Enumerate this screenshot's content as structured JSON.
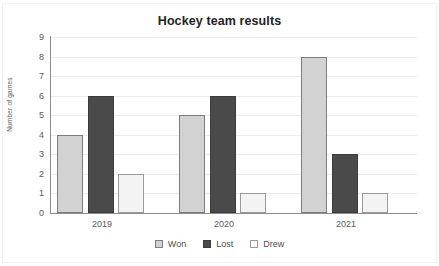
{
  "chart_data": {
    "type": "bar",
    "title": "Hockey team results",
    "xlabel": "",
    "ylabel": "Number of games",
    "categories": [
      "2019",
      "2020",
      "2021"
    ],
    "series": [
      {
        "name": "Won",
        "values": [
          4,
          5,
          8
        ],
        "color": "#d2d2d2"
      },
      {
        "name": "Lost",
        "values": [
          6,
          6,
          3
        ],
        "color": "#4a4a4a"
      },
      {
        "name": "Drew",
        "values": [
          2,
          1,
          1
        ],
        "color": "#f3f3f3"
      }
    ],
    "ylim": [
      0,
      9
    ],
    "yticks": [
      0,
      1,
      2,
      3,
      4,
      5,
      6,
      7,
      8,
      9
    ],
    "ytick_labels": [
      "0",
      "1",
      "2",
      "3",
      "4",
      "5",
      "6",
      "7",
      "8",
      "9"
    ],
    "grid": "horizontal",
    "legend_position": "bottom"
  },
  "axis": {
    "y_label": "Number of games",
    "y_ticks": [
      "9",
      "8",
      "7",
      "6",
      "5",
      "4",
      "3",
      "2",
      "1",
      "0"
    ],
    "x_ticks": [
      "2019",
      "2020",
      "2021"
    ]
  },
  "legend": {
    "items": [
      {
        "label": "Won",
        "swatch": "won-swatch"
      },
      {
        "label": "Lost",
        "swatch": "lost-swatch"
      },
      {
        "label": "Drew",
        "swatch": "drew-swatch"
      }
    ]
  }
}
